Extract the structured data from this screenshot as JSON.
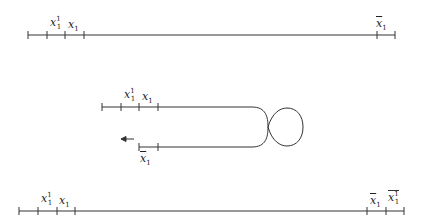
{
  "diagram": {
    "stroke_color": "#333333",
    "top_line": {
      "labels": [
        {
          "base": "x",
          "sub": "1",
          "sup": "1",
          "bar": false
        },
        {
          "base": "x",
          "sub": "1",
          "sup": "",
          "bar": false
        },
        {
          "base": "x",
          "sub": "1",
          "sup": "",
          "bar": true
        }
      ]
    },
    "middle_figure": {
      "upper_labels": [
        {
          "base": "x",
          "sub": "1",
          "sup": "1",
          "bar": false
        },
        {
          "base": "x",
          "sub": "1",
          "sup": "",
          "bar": false
        }
      ],
      "lower_labels": [
        {
          "base": "x",
          "sub": "1",
          "sup": "",
          "bar": true
        }
      ],
      "arrow_direction": "left"
    },
    "bottom_line": {
      "labels": [
        {
          "base": "x",
          "sub": "1",
          "sup": "1",
          "bar": false
        },
        {
          "base": "x",
          "sub": "1",
          "sup": "",
          "bar": false
        },
        {
          "base": "x",
          "sub": "1",
          "sup": "",
          "bar": true
        },
        {
          "base": "x",
          "sub": "1",
          "sup": "1",
          "bar": true
        }
      ]
    }
  }
}
